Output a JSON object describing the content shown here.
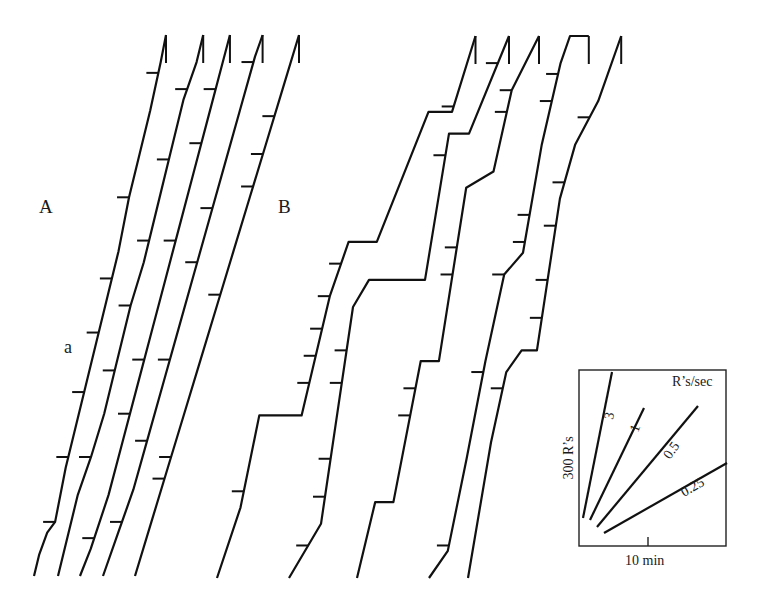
{
  "chart_data": {
    "type": "line",
    "title": "",
    "panels": [
      {
        "label": "A",
        "annotation": "a",
        "records": [
          {
            "name": "A1",
            "points": [
              [
                0,
                0
              ],
              [
                0.02,
                0.04
              ],
              [
                0.05,
                0.08
              ],
              [
                0.08,
                0.1
              ],
              [
                0.12,
                0.2
              ],
              [
                0.16,
                0.28
              ],
              [
                0.2,
                0.36
              ],
              [
                0.24,
                0.44
              ],
              [
                0.28,
                0.52
              ],
              [
                0.32,
                0.6
              ],
              [
                0.36,
                0.7
              ],
              [
                0.4,
                0.78
              ],
              [
                0.44,
                0.86
              ],
              [
                0.48,
                0.95
              ],
              [
                0.5,
                1.0
              ]
            ],
            "pips": [
              0.1,
              0.22,
              0.34,
              0.45,
              0.55,
              0.7,
              0.93
            ]
          },
          {
            "name": "A2",
            "points": [
              [
                0,
                0
              ],
              [
                0.06,
                0.15
              ],
              [
                0.1,
                0.22
              ],
              [
                0.14,
                0.3
              ],
              [
                0.18,
                0.4
              ],
              [
                0.22,
                0.5
              ],
              [
                0.26,
                0.58
              ],
              [
                0.3,
                0.68
              ],
              [
                0.34,
                0.78
              ],
              [
                0.38,
                0.88
              ],
              [
                0.42,
                0.95
              ],
              [
                0.44,
                1.0
              ]
            ],
            "pips": [
              0.22,
              0.38,
              0.5,
              0.62,
              0.77,
              0.9
            ]
          },
          {
            "name": "A3",
            "points": [
              [
                0,
                0
              ],
              [
                0.03,
                0.05
              ],
              [
                0.08,
                0.15
              ],
              [
                0.12,
                0.25
              ],
              [
                0.16,
                0.35
              ],
              [
                0.2,
                0.45
              ],
              [
                0.24,
                0.55
              ],
              [
                0.28,
                0.65
              ],
              [
                0.32,
                0.75
              ],
              [
                0.36,
                0.85
              ],
              [
                0.4,
                0.95
              ],
              [
                0.42,
                1.0
              ]
            ],
            "pips": [
              0.07,
              0.3,
              0.4,
              0.62,
              0.8,
              0.9
            ]
          },
          {
            "name": "A4",
            "points": [
              [
                0,
                0
              ],
              [
                0.04,
                0.08
              ],
              [
                0.08,
                0.16
              ],
              [
                0.12,
                0.26
              ],
              [
                0.16,
                0.36
              ],
              [
                0.2,
                0.46
              ],
              [
                0.24,
                0.56
              ],
              [
                0.28,
                0.66
              ],
              [
                0.32,
                0.76
              ],
              [
                0.36,
                0.86
              ],
              [
                0.4,
                0.96
              ],
              [
                0.42,
                1.0
              ]
            ],
            "pips": [
              0.1,
              0.25,
              0.4,
              0.58,
              0.68,
              0.95
            ]
          },
          {
            "name": "A5",
            "points": [
              [
                0,
                0
              ],
              [
                0.04,
                0.1
              ],
              [
                0.08,
                0.2
              ],
              [
                0.12,
                0.3
              ],
              [
                0.16,
                0.4
              ],
              [
                0.2,
                0.5
              ],
              [
                0.24,
                0.6
              ],
              [
                0.28,
                0.7
              ],
              [
                0.32,
                0.8
              ],
              [
                0.36,
                0.9
              ],
              [
                0.4,
                1.0
              ]
            ],
            "pips": [
              0.18,
              0.22,
              0.52,
              0.72,
              0.78,
              0.85
            ]
          }
        ]
      },
      {
        "label": "B",
        "annotation": "",
        "records": [
          {
            "name": "B1",
            "points": [
              [
                0,
                0
              ],
              [
                0.05,
                0.13
              ],
              [
                0.09,
                0.3
              ],
              [
                0.18,
                0.3
              ],
              [
                0.24,
                0.52
              ],
              [
                0.28,
                0.62
              ],
              [
                0.34,
                0.62
              ],
              [
                0.45,
                0.86
              ],
              [
                0.5,
                0.86
              ],
              [
                0.55,
                1.0
              ]
            ],
            "pips": [
              0.16,
              0.36,
              0.41,
              0.46,
              0.52,
              0.58,
              0.87
            ]
          },
          {
            "name": "B2",
            "points": [
              [
                0,
                0
              ],
              [
                0.08,
                0.1
              ],
              [
                0.12,
                0.3
              ],
              [
                0.16,
                0.5
              ],
              [
                0.2,
                0.55
              ],
              [
                0.34,
                0.55
              ],
              [
                0.4,
                0.82
              ],
              [
                0.45,
                0.82
              ],
              [
                0.55,
                1.0
              ]
            ],
            "pips": [
              0.06,
              0.15,
              0.22,
              0.36,
              0.42,
              0.78,
              0.95
            ]
          },
          {
            "name": "B3",
            "points": [
              [
                0,
                0
              ],
              [
                0.04,
                0.14
              ],
              [
                0.08,
                0.14
              ],
              [
                0.14,
                0.4
              ],
              [
                0.18,
                0.4
              ],
              [
                0.24,
                0.72
              ],
              [
                0.3,
                0.75
              ],
              [
                0.34,
                0.9
              ],
              [
                0.4,
                1.0
              ]
            ],
            "pips": [
              0.3,
              0.35,
              0.56,
              0.61,
              0.86,
              0.9
            ]
          },
          {
            "name": "B4",
            "points": [
              [
                0,
                0
              ],
              [
                0.04,
                0.05
              ],
              [
                0.08,
                0.22
              ],
              [
                0.12,
                0.4
              ],
              [
                0.16,
                0.56
              ],
              [
                0.2,
                0.6
              ],
              [
                0.24,
                0.8
              ],
              [
                0.28,
                0.95
              ],
              [
                0.3,
                1.0
              ],
              [
                0.34,
                1.0
              ]
            ],
            "pips": [
              0.06,
              0.38,
              0.56,
              0.62,
              0.67,
              0.88,
              0.93
            ]
          },
          {
            "name": "B5",
            "points": [
              [
                0,
                0
              ],
              [
                0.06,
                0.25
              ],
              [
                0.1,
                0.38
              ],
              [
                0.14,
                0.42
              ],
              [
                0.18,
                0.42
              ],
              [
                0.24,
                0.7
              ],
              [
                0.28,
                0.8
              ],
              [
                0.34,
                0.88
              ],
              [
                0.4,
                1.0
              ]
            ],
            "pips": [
              0.35,
              0.48,
              0.55,
              0.65,
              0.73,
              0.85
            ]
          }
        ]
      }
    ],
    "inset": {
      "xlabel": "10 min",
      "ylabel": "300 R’s",
      "title": "R’s/sec",
      "rates": [
        {
          "label": "3",
          "value": 3
        },
        {
          "label": "1",
          "value": 1
        },
        {
          "label": "0.5",
          "value": 0.5
        },
        {
          "label": "0.25",
          "value": 0.25
        }
      ]
    }
  }
}
